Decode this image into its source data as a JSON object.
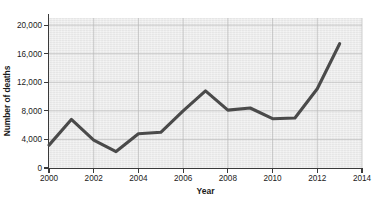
{
  "chart_data": {
    "type": "line",
    "title": "",
    "subtitle": "",
    "xlabel": "Year",
    "ylabel": "Number of deaths",
    "x": [
      2000,
      2001,
      2002,
      2003,
      2004,
      2005,
      2006,
      2007,
      2008,
      2009,
      2010,
      2011,
      2012,
      2013
    ],
    "values": [
      3200,
      6800,
      3900,
      2300,
      4800,
      5000,
      8000,
      10800,
      8100,
      8400,
      6900,
      7000,
      11100,
      17400
    ],
    "series": [
      {
        "name": "Number of deaths",
        "values": [
          3200,
          6800,
          3900,
          2300,
          4800,
          5000,
          8000,
          10800,
          8100,
          8400,
          6900,
          7000,
          11100,
          17400
        ]
      }
    ],
    "xlim": [
      2000,
      2014
    ],
    "ylim": [
      0,
      21000
    ],
    "xticks": [
      2000,
      2002,
      2004,
      2006,
      2008,
      2010,
      2012,
      2014
    ],
    "xtick_labels": [
      "2000",
      "2002",
      "2004",
      "2006",
      "2008",
      "2010",
      "2012",
      "2014"
    ],
    "yticks": [
      0,
      4000,
      8000,
      12000,
      16000,
      20000
    ],
    "ytick_labels": [
      "0",
      "4,000",
      "8,000",
      "12,000",
      "16,000",
      "20,000"
    ],
    "grid": true,
    "grid_axis": "both",
    "legend": false,
    "legend_position": "none",
    "annotations": [],
    "colors": {
      "line": "#4a4a4a",
      "plot_background": "#ebebeb",
      "gridline": "#b9b9b9",
      "axis": "#3a3a3a",
      "text": "#1a1a1a",
      "figure_background": "#ffffff"
    }
  }
}
